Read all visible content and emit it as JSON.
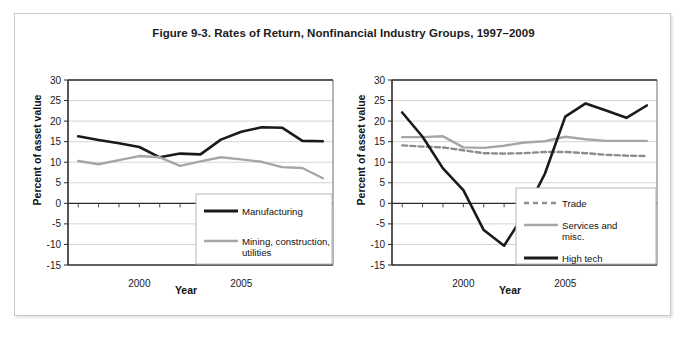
{
  "figure": {
    "title": "Figure 9-3. Rates of Return, Nonfinancial Industry Groups, 1997–2009"
  },
  "chart_data": [
    {
      "type": "line",
      "panel": "left",
      "title": "",
      "xlabel": "Year",
      "ylabel": "Percent of asset value",
      "x": [
        1997,
        1998,
        1999,
        2000,
        2001,
        2002,
        2003,
        2004,
        2005,
        2006,
        2007,
        2008,
        2009
      ],
      "xlim": [
        1996.5,
        2009.5
      ],
      "ylim": [
        -15,
        30
      ],
      "ytick_labels": [
        "30",
        "25",
        "20",
        "15",
        "10",
        "5",
        "0",
        "-5",
        "-10",
        "-15"
      ],
      "yticks": [
        30,
        25,
        20,
        15,
        10,
        5,
        0,
        -5,
        -10,
        -15
      ],
      "xtick_labels": [
        "2000",
        "2005"
      ],
      "xticks": [
        2000,
        2005
      ],
      "grid": true,
      "legend_position": "lower-right",
      "series": [
        {
          "name": "Manufacturing",
          "color": "#1a1a1a",
          "style": "solid",
          "values": [
            16.3,
            15.4,
            14.6,
            13.7,
            11.2,
            12.1,
            11.9,
            15.5,
            17.4,
            18.5,
            18.4,
            15.2,
            15.1
          ]
        },
        {
          "name": "Mining, construction, utilities",
          "color": "#a6a6a6",
          "style": "solid",
          "values": [
            10.3,
            9.5,
            10.5,
            11.5,
            11.2,
            9.1,
            10.2,
            11.2,
            10.7,
            10.1,
            8.8,
            8.6,
            6.1
          ]
        }
      ]
    },
    {
      "type": "line",
      "panel": "right",
      "title": "",
      "xlabel": "Year",
      "ylabel": "Percent of asset value",
      "x": [
        1997,
        1998,
        1999,
        2000,
        2001,
        2002,
        2003,
        2004,
        2005,
        2006,
        2007,
        2008,
        2009
      ],
      "xlim": [
        1996.5,
        2009.5
      ],
      "ylim": [
        -15,
        30
      ],
      "ytick_labels": [
        "30",
        "25",
        "20",
        "15",
        "10",
        "5",
        "0",
        "-5",
        "-10",
        "-15"
      ],
      "yticks": [
        30,
        25,
        20,
        15,
        10,
        5,
        0,
        -5,
        -10,
        -15
      ],
      "xtick_labels": [
        "2000",
        "2005"
      ],
      "xticks": [
        2000,
        2005
      ],
      "grid": true,
      "legend_position": "lower-right",
      "series": [
        {
          "name": "Trade",
          "color": "#8c8c8c",
          "style": "dashed",
          "values": [
            14.1,
            13.8,
            13.6,
            12.9,
            12.2,
            12.1,
            12.2,
            12.5,
            12.5,
            12.2,
            11.8,
            11.6,
            11.5
          ]
        },
        {
          "name": "Services and misc.",
          "color": "#a6a6a6",
          "style": "solid",
          "values": [
            16.1,
            16.1,
            16.3,
            13.6,
            13.5,
            14.0,
            14.8,
            15.1,
            16.2,
            15.6,
            15.2,
            15.2,
            15.2
          ]
        },
        {
          "name": "High tech",
          "color": "#1a1a1a",
          "style": "solid",
          "values": [
            22.1,
            16.2,
            8.5,
            3.2,
            -6.5,
            -10.3,
            -2.5,
            7.2,
            21.1,
            24.3,
            22.6,
            20.8,
            23.8
          ]
        }
      ]
    }
  ],
  "legends": {
    "left": [
      {
        "label": "Manufacturing",
        "color": "#1a1a1a",
        "style": "solid"
      },
      {
        "label": "Mining, construction,",
        "label2": "utilities",
        "color": "#a6a6a6",
        "style": "solid"
      }
    ],
    "right": [
      {
        "label": "Trade",
        "color": "#8c8c8c",
        "style": "dashed"
      },
      {
        "label": "Services and",
        "label2": "misc.",
        "color": "#a6a6a6",
        "style": "solid"
      },
      {
        "label": "High tech",
        "color": "#1a1a1a",
        "style": "solid"
      }
    ]
  }
}
